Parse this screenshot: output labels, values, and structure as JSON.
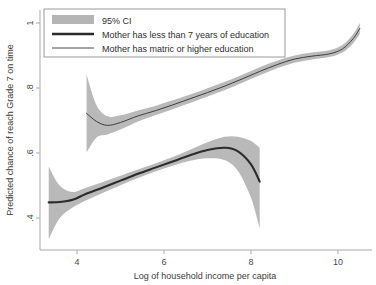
{
  "chart_data": {
    "type": "line",
    "title": "",
    "xlabel": "Log of household income per capita",
    "ylabel": "Predicted chance of reach Grade 7 on time",
    "xlim": [
      3.2,
      10.6
    ],
    "ylim": [
      0.33,
      1.02
    ],
    "xticks": [
      4,
      6,
      8,
      10
    ],
    "xticklabels": [
      "4",
      "6",
      "8",
      "10"
    ],
    "yticks": [
      0.4,
      0.6,
      0.8,
      1.0
    ],
    "yticklabels": [
      ".4",
      ".6",
      ".8",
      "1"
    ],
    "grid": false,
    "legend_position": "top-left",
    "ci_level": "95% CI",
    "series": [
      {
        "name": "Mother has less than 7 years of education",
        "style": "thick",
        "x": [
          3.35,
          3.6,
          3.9,
          4.2,
          4.6,
          5.0,
          5.4,
          5.8,
          6.2,
          6.6,
          7.0,
          7.4,
          7.7,
          8.0,
          8.2
        ],
        "y": [
          0.448,
          0.449,
          0.456,
          0.474,
          0.494,
          0.515,
          0.536,
          0.555,
          0.574,
          0.593,
          0.609,
          0.616,
          0.605,
          0.565,
          0.512
        ],
        "ci_lower": [
          0.335,
          0.399,
          0.432,
          0.454,
          0.478,
          0.501,
          0.523,
          0.543,
          0.561,
          0.576,
          0.584,
          0.578,
          0.545,
          0.462,
          0.368
        ],
        "ci_upper": [
          0.558,
          0.5,
          0.48,
          0.493,
          0.511,
          0.53,
          0.549,
          0.568,
          0.588,
          0.61,
          0.633,
          0.65,
          0.65,
          0.637,
          0.616
        ]
      },
      {
        "name": "Mother has matric or higher education",
        "style": "thin",
        "x": [
          4.22,
          4.45,
          4.7,
          5.0,
          5.4,
          5.8,
          6.2,
          6.6,
          7.0,
          7.4,
          7.8,
          8.2,
          8.6,
          9.0,
          9.4,
          9.8,
          10.1,
          10.35,
          10.5
        ],
        "y": [
          0.722,
          0.697,
          0.685,
          0.694,
          0.714,
          0.73,
          0.748,
          0.767,
          0.786,
          0.806,
          0.828,
          0.851,
          0.872,
          0.889,
          0.898,
          0.905,
          0.92,
          0.952,
          0.983
        ],
        "ci_lower": [
          0.602,
          0.648,
          0.657,
          0.672,
          0.697,
          0.716,
          0.735,
          0.754,
          0.774,
          0.794,
          0.816,
          0.839,
          0.861,
          0.878,
          0.888,
          0.895,
          0.909,
          0.938,
          0.966
        ],
        "ci_upper": [
          0.841,
          0.747,
          0.713,
          0.716,
          0.731,
          0.745,
          0.762,
          0.78,
          0.799,
          0.819,
          0.841,
          0.864,
          0.884,
          0.9,
          0.909,
          0.916,
          0.932,
          0.966,
          1.0
        ]
      }
    ]
  },
  "legend": {
    "items": [
      {
        "label": "95% CI",
        "marker": "band-swatch"
      },
      {
        "label": "Mother has less than 7 years of education",
        "marker": "thick-line"
      },
      {
        "label": "Mother has matric or higher education",
        "marker": "thin-line"
      }
    ]
  },
  "colors": {
    "ci_band": "#b5b5b5",
    "thick_line": "#2b2b2b",
    "thin_line": "#3d3d3d",
    "axis": "#a9a9a9",
    "background": "#ffffff"
  }
}
